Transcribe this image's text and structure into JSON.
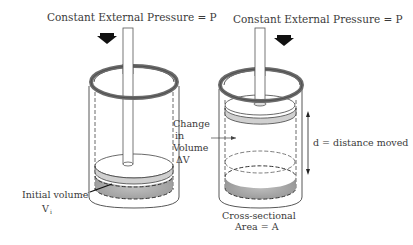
{
  "diagram": {
    "left": {
      "title": "Constant External Pressure = P",
      "label_change": [
        "Change",
        "in",
        "Volume",
        "ΔV"
      ],
      "label_initial": "Initial volume",
      "label_initial_symbol": "V",
      "label_initial_subscript": "i"
    },
    "right": {
      "title": "Constant External Pressure = P",
      "label_distance": "d = distance moved",
      "label_area_line1": "Cross-sectional",
      "label_area_line2": "Area = A"
    },
    "colors": {
      "ring": "#6b6b6b",
      "gas": "#a9a9a9",
      "line": "#4a4a4a",
      "arrow": "#111111"
    }
  }
}
